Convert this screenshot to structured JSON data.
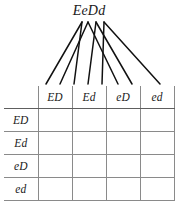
{
  "diagram": {
    "type": "punnett-square",
    "title": "EeDd",
    "title_meaning": "dihybrid parent genotype",
    "gamete_count": 4,
    "grid_size": "4x4"
  },
  "punnett": {
    "corner_label": "",
    "column_headers": [
      "ED",
      "Ed",
      "eD",
      "ed"
    ],
    "row_headers": [
      "ED",
      "Ed",
      "eD",
      "ed"
    ],
    "cells": [
      [
        "",
        "",
        "",
        ""
      ],
      [
        "",
        "",
        "",
        ""
      ],
      [
        "",
        "",
        "",
        ""
      ],
      [
        "",
        "",
        "",
        ""
      ]
    ]
  },
  "fan": {
    "source_label": "EeDd",
    "branches": [
      {
        "allele": "E",
        "x": 82,
        "targets": [
          46,
          74
        ]
      },
      {
        "allele": "e",
        "x": 88,
        "targets": [
          60,
          118
        ]
      },
      {
        "allele": "D",
        "x": 96,
        "targets": [
          88,
          132
        ]
      },
      {
        "allele": "d",
        "x": 104,
        "targets": [
          102,
          160
        ]
      }
    ],
    "top_y": 22,
    "bottom_y": 84
  },
  "colors": {
    "ink": "#1a1a1a",
    "grid_line": "#8a8a8a",
    "grid_line_strong": "#5e5e5e",
    "fan_line": "#111111",
    "background": "#ffffff"
  }
}
